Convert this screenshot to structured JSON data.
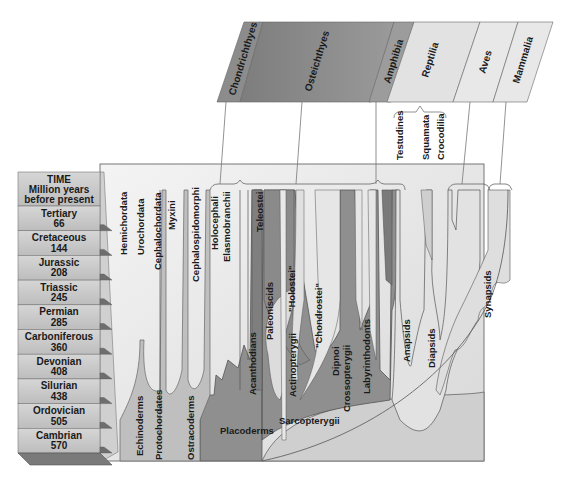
{
  "diagram": {
    "type": "phylogeny-through-geologic-time",
    "time_header": {
      "line1": "TIME",
      "line2": "Million years",
      "line3": "before present"
    },
    "periods": [
      {
        "name": "Tertiary",
        "mya": "66"
      },
      {
        "name": "Cretaceous",
        "mya": "144"
      },
      {
        "name": "Jurassic",
        "mya": "208"
      },
      {
        "name": "Triassic",
        "mya": "245"
      },
      {
        "name": "Permian",
        "mya": "285"
      },
      {
        "name": "Carboniferous",
        "mya": "360"
      },
      {
        "name": "Devonian",
        "mya": "408"
      },
      {
        "name": "Silurian",
        "mya": "438"
      },
      {
        "name": "Ordovician",
        "mya": "505"
      },
      {
        "name": "Cambrian",
        "mya": "570"
      }
    ],
    "classes": [
      {
        "name": "Chondrichthyes",
        "color": "#8c8c8c"
      },
      {
        "name": "Osteichthyes",
        "color": "#8f8f8f"
      },
      {
        "name": "Amphibia",
        "color": "#9a9a9a"
      },
      {
        "name": "Reptilia",
        "color": "#e2e2e2"
      },
      {
        "name": "Aves",
        "color": "#e6e6e6"
      },
      {
        "name": "Mammalia",
        "color": "#e6e6e6"
      }
    ],
    "reptile_groups": [
      "Testudines",
      "Squamata",
      "Crocodilia"
    ],
    "lineages": {
      "hemichordata": "Hemichordata",
      "urochordata": "Urochordata",
      "cephalochordata": "Cephalochordata",
      "myxini": "Myxini",
      "cephalospidomorphi": "Cephalospidomorphi",
      "holocephali": "Holocephali",
      "elasmobranchii": "Elasmobranchii",
      "teleostei": "Teleostei",
      "paleoniscids": "Paleoniscids",
      "holostei": "\"Holostei\"",
      "chondrostei": "\"Chondrostei\"",
      "acanthodians": "Acanthodians",
      "actinopterygii": "Actinopterygii",
      "dipnoi": "Dipnoi",
      "crossopterygii": "Crossopterygii",
      "labyrinthodonts": "Labyrinthodonts",
      "anapsids": "Anapsids",
      "diapsids": "Diapsids",
      "synapsids": "Synapsids",
      "echinoderms": "Echinoderms",
      "protochordates": "Protochordates",
      "ostracoderms": "Ostracoderms",
      "placoderms": "Placoderms",
      "sarcopterygii": "Sarcopterygii"
    },
    "colors": {
      "dark_gray": "#8a8a8a",
      "mid_gray": "#a6a6a6",
      "light_gray": "#d9d9d9",
      "panel_bg": "#ebebeb",
      "outline": "#555555"
    }
  }
}
